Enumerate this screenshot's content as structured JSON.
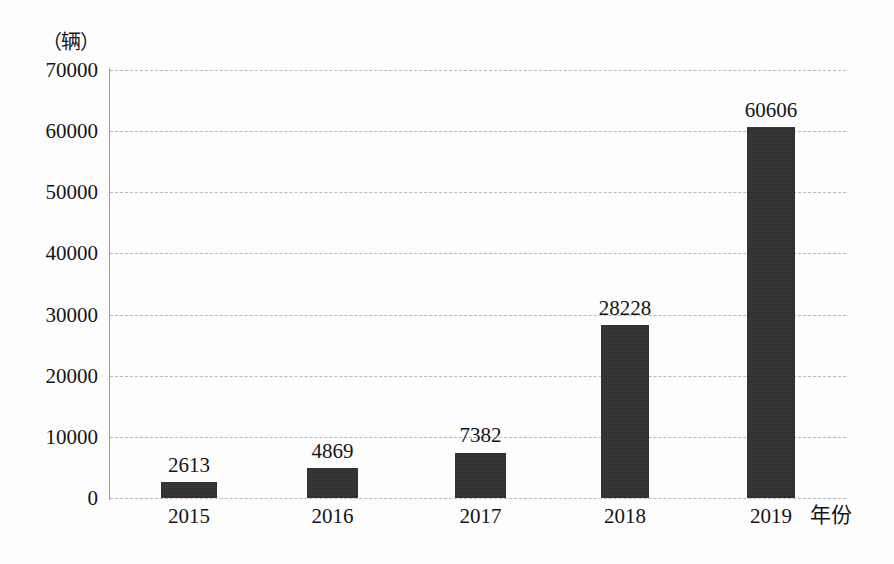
{
  "chart_data": {
    "type": "bar",
    "title": "",
    "subtitle": "",
    "categories": [
      "2015",
      "2016",
      "2017",
      "2018",
      "2019"
    ],
    "values": [
      2613,
      4869,
      7382,
      28228,
      60606
    ],
    "series": [
      {
        "name": "",
        "values": [
          2613,
          4869,
          7382,
          28228,
          60606
        ]
      }
    ],
    "data_labels": [
      "2613",
      "4869",
      "7382",
      "28228",
      "60606"
    ],
    "xlabel": "年份",
    "ylabel": "",
    "yunit": "（辆）",
    "ylim": [
      0,
      70000
    ],
    "ytick_labels": [
      "0",
      "10000",
      "20000",
      "30000",
      "40000",
      "50000",
      "60000",
      "70000"
    ],
    "ytick_values": [
      0,
      10000,
      20000,
      30000,
      40000,
      50000,
      60000,
      70000
    ],
    "grid": true,
    "grid_style": "dashed",
    "legend": false,
    "legend_position": "none",
    "bar_color": "#2b2b2b",
    "grid_color": "#b9b9b9",
    "axis_color": "#9d9d9d",
    "background_color": "#fdfdfd",
    "text_color": "#141414"
  }
}
